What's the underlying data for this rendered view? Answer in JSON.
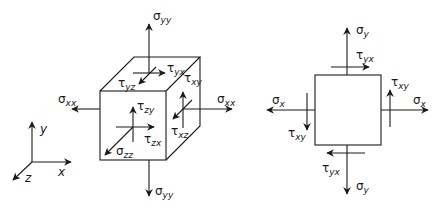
{
  "cube_diagram": {
    "labels": {
      "sigma_yy_top": {
        "sym": "σ",
        "sub": "yy"
      },
      "sigma_yy_bottom": {
        "sym": "σ",
        "sub": "yy"
      },
      "sigma_xx_left": {
        "sym": "σ",
        "sub": "xx"
      },
      "sigma_xx_right": {
        "sym": "σ",
        "sub": "xx"
      },
      "sigma_zz": {
        "sym": "σ",
        "sub": "zz"
      },
      "tau_yx": {
        "sym": "τ",
        "sub": "yx"
      },
      "tau_yz": {
        "sym": "τ",
        "sub": "yz"
      },
      "tau_xy": {
        "sym": "τ",
        "sub": "xy"
      },
      "tau_xz": {
        "sym": "τ",
        "sub": "xz"
      },
      "tau_zy": {
        "sym": "τ",
        "sub": "zy"
      },
      "tau_zx": {
        "sym": "τ",
        "sub": "zx"
      }
    },
    "axes": {
      "x": "x",
      "y": "y",
      "z": "z"
    }
  },
  "square_diagram": {
    "labels": {
      "sigma_y_top": {
        "sym": "σ",
        "sub": "y"
      },
      "sigma_y_bottom": {
        "sym": "σ",
        "sub": "y"
      },
      "sigma_x_left": {
        "sym": "σ",
        "sub": "x"
      },
      "sigma_x_right": {
        "sym": "σ",
        "sub": "x"
      },
      "tau_yx_top": {
        "sym": "τ",
        "sub": "yx"
      },
      "tau_yx_bottom": {
        "sym": "τ",
        "sub": "yx"
      },
      "tau_xy_right": {
        "sym": "τ",
        "sub": "xy"
      },
      "tau_xy_left": {
        "sym": "τ",
        "sub": "xy"
      }
    }
  }
}
